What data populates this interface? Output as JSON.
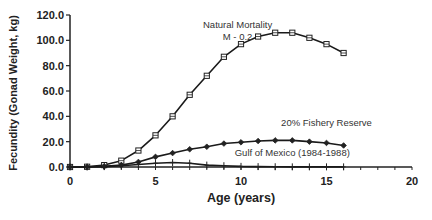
{
  "chart_data": {
    "type": "line",
    "title": "",
    "xlabel": "Age (years)",
    "ylabel": "Fecundity (Gonad Weight, kg)",
    "xlim": [
      0,
      20
    ],
    "ylim": [
      0,
      120
    ],
    "x_ticks": [
      "0",
      "5",
      "10",
      "15",
      "20"
    ],
    "y_ticks": [
      "0.0",
      "20.0",
      "40.0",
      "60.0",
      "80.0",
      "100.0",
      "120.0"
    ],
    "grid": false,
    "legend": "none (inline annotations)",
    "x": [
      0,
      1,
      2,
      3,
      4,
      5,
      6,
      7,
      8,
      9,
      10,
      11,
      12,
      13,
      14,
      15,
      16
    ],
    "series": [
      {
        "name": "Natural Mortality M - 0.2",
        "marker": "square",
        "values": [
          0,
          0.2,
          1.5,
          5,
          13,
          25,
          40,
          57,
          72,
          87,
          97,
          103,
          106,
          106,
          102,
          97,
          90
        ]
      },
      {
        "name": "20% Fishery Reserve",
        "marker": "diamond",
        "values": [
          0,
          0.1,
          0.5,
          1.5,
          4,
          8,
          11,
          14,
          16,
          18.5,
          19.5,
          20.5,
          21,
          21,
          20,
          19,
          17
        ]
      },
      {
        "name": "Gulf of Mexico (1984-1988)",
        "marker": "plus",
        "values": [
          0,
          0,
          0.3,
          1,
          2,
          3,
          3.5,
          3,
          1.5,
          1,
          0.5,
          0.3,
          0.2,
          0.1,
          0.1,
          0.1,
          0.1
        ]
      }
    ],
    "annotations": [
      {
        "text": "Natural Mortality",
        "x": 9.8,
        "y": 110
      },
      {
        "text": "M - 0.2",
        "x": 9.8,
        "y": 100
      },
      {
        "text": "20% Fishery Reserve",
        "x": 15,
        "y": 32
      },
      {
        "text": "Gulf of Mexico (1984-1988)",
        "x": 13,
        "y": 9
      }
    ]
  }
}
